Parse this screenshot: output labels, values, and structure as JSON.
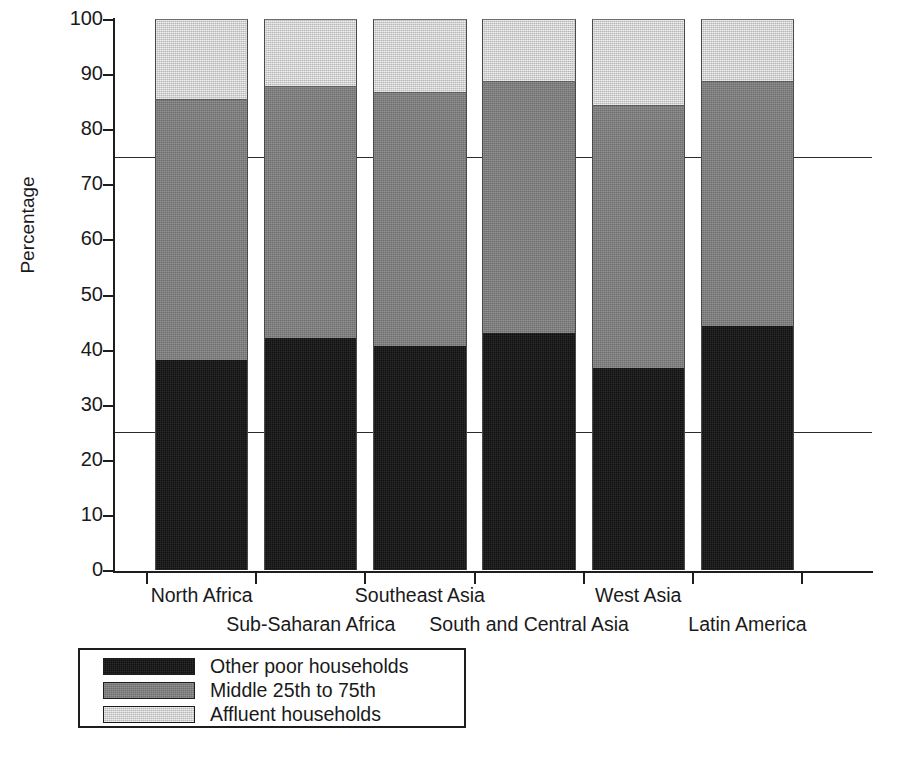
{
  "chart_data": {
    "type": "bar",
    "subtype": "stacked-100-percent",
    "title": "",
    "xlabel": "",
    "ylabel": "Percentage",
    "ylim": [
      0,
      100
    ],
    "yticks": [
      0,
      10,
      20,
      30,
      40,
      50,
      60,
      70,
      80,
      90,
      100
    ],
    "ytick_labels": [
      "0",
      "10",
      "20",
      "30",
      "40",
      "50",
      "60",
      "70",
      "80",
      "90",
      "100"
    ],
    "grid": false,
    "reference_lines": [
      25,
      75
    ],
    "legend_position": "below-left",
    "categories": [
      "North Africa",
      "Sub-Saharan Africa",
      "Southeast Asia",
      "South and Central Asia",
      "West Asia",
      "Latin America"
    ],
    "series": [
      {
        "name": "Other poor households",
        "color": "#111111",
        "values": [
          38.2,
          42.1,
          40.6,
          43.0,
          36.6,
          44.3
        ]
      },
      {
        "name": "Middle 25th to 75th",
        "color": "#7b7b7b",
        "values": [
          47.3,
          45.8,
          46.2,
          45.8,
          47.8,
          44.5
        ]
      },
      {
        "name": "Affluent households",
        "color": "#c9c9c9",
        "values": [
          14.5,
          12.1,
          13.2,
          11.2,
          15.6,
          11.2
        ]
      }
    ],
    "cumulative_tops": {
      "other_poor": [
        38.2,
        42.1,
        40.6,
        43.0,
        36.6,
        44.3
      ],
      "middle": [
        85.5,
        87.9,
        86.8,
        88.8,
        84.4,
        88.8
      ],
      "affluent": [
        100,
        100,
        100,
        100,
        100,
        100
      ]
    }
  },
  "axes": {
    "y_axis_label": "Percentage",
    "y_tick_labels": [
      "100",
      "90",
      "80",
      "70",
      "60",
      "50",
      "40",
      "30",
      "20",
      "10",
      "0"
    ],
    "x_tick_labels_row1": [
      "North Africa",
      "Southeast Asia",
      "West Asia"
    ],
    "x_tick_labels_row2": [
      "Sub-Saharan Africa",
      "South and Central Asia",
      "Latin America"
    ]
  },
  "legend": {
    "items": [
      {
        "label": "Other poor households",
        "swatch": "dark"
      },
      {
        "label": "Middle 25th to 75th",
        "swatch": "mid"
      },
      {
        "label": "Affluent households",
        "swatch": "light"
      }
    ]
  },
  "caption": {
    "text": ""
  }
}
